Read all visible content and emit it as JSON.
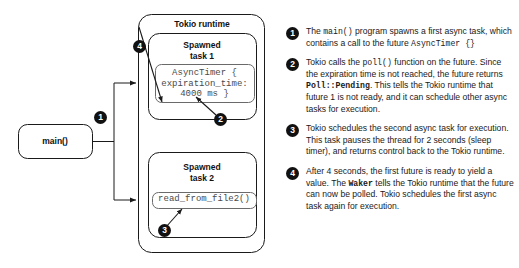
{
  "diagram": {
    "nodes": {
      "main": {
        "label": "main()"
      },
      "runtime": {
        "label": "Tokio runtime"
      },
      "task1": {
        "label": "Spawned\ntask 1"
      },
      "task1_code": {
        "label": "AsyncTimer {\nexpiration_time:\n4000 ms }"
      },
      "task2": {
        "label": "Spawned\ntask 2"
      },
      "task2_code": {
        "label": "read_from_file2()"
      }
    },
    "badges": {
      "one": "1",
      "two": "2",
      "three": "3",
      "four": "4"
    },
    "colors": {
      "stroke": "#1a1a1a",
      "badge_fill": "#111111",
      "badge_text": "#ffffff",
      "code_text": "#4a4a4a",
      "background": "#ffffff"
    }
  },
  "legend": {
    "items": [
      {
        "number": "1",
        "parts": [
          {
            "t": "The ",
            "style": "plain"
          },
          {
            "t": "main()",
            "style": "code"
          },
          {
            "t": " program spawns a first async task, which contains a call to the future ",
            "style": "plain"
          },
          {
            "t": "AsyncTimer {}",
            "style": "code"
          }
        ]
      },
      {
        "number": "2",
        "parts": [
          {
            "t": "Tokio calls the ",
            "style": "plain"
          },
          {
            "t": "poll()",
            "style": "code"
          },
          {
            "t": " function on the future. Since the expiration time is not reached, the future returns ",
            "style": "plain"
          },
          {
            "t": "Poll::Pending",
            "style": "code-bold"
          },
          {
            "t": ". This tells the Tokio runtime that future 1 is not ready, and it can schedule other async tasks for execution.",
            "style": "plain"
          }
        ]
      },
      {
        "number": "3",
        "parts": [
          {
            "t": "Tokio schedules the second async task for execution. This task pauses the thread for 2 seconds (sleep timer), and returns control back to the Tokio runtime.",
            "style": "plain"
          }
        ]
      },
      {
        "number": "4",
        "parts": [
          {
            "t": "After 4 seconds, the first future is ready to yield a value. The ",
            "style": "plain"
          },
          {
            "t": "Waker",
            "style": "code-bold"
          },
          {
            "t": " tells the Tokio runtime that the future can now be polled. Tokio schedules the first async task again for execution.",
            "style": "plain"
          }
        ]
      }
    ]
  }
}
